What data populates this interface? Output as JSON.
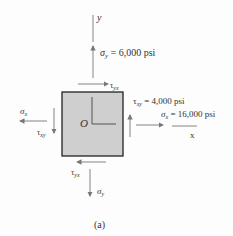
{
  "diagram": {
    "type": "plane stress element",
    "origin_label": "O",
    "axes": {
      "x": "x",
      "y": "y"
    },
    "stresses": {
      "sigma_y": {
        "symbol": "σ",
        "sub": "y",
        "value_text": " = 6,000 psi"
      },
      "sigma_x": {
        "symbol": "σ",
        "sub": "x",
        "value_text": " = 16,000 psi"
      },
      "tau_xy": {
        "symbol": "τ",
        "sub": "xy",
        "value_text": " = 4,000 psi"
      },
      "tau_yx": {
        "symbol": "τ",
        "sub": "yx"
      }
    },
    "caption": "(a)",
    "colors": {
      "element_fill": "#cfcfcf",
      "element_border": "#222222",
      "arrow": "#777777",
      "text": "#333333"
    }
  }
}
